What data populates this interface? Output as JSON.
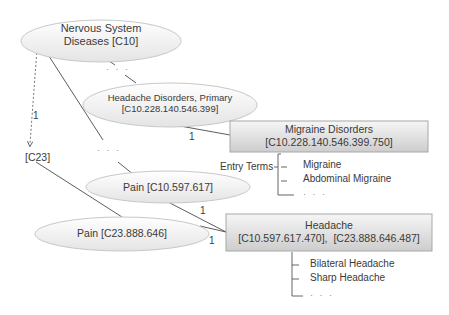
{
  "nodes": {
    "nervous_system": {
      "line1": "Nervous System",
      "line2": "Diseases [C10]",
      "shape": "ellipse"
    },
    "headache_disorders_primary": {
      "line1": "Headache Disorders, Primary",
      "line2": "[C10.228.140.546.399]",
      "shape": "ellipse"
    },
    "migraine_disorders": {
      "line1": "Migraine Disorders",
      "line2": "[C10.228.140.546.399.750]",
      "shape": "box"
    },
    "pain_c10": {
      "label": "Pain [C10.597.617]",
      "shape": "ellipse"
    },
    "pain_c23": {
      "label": "Pain [C23.888.646]",
      "shape": "ellipse"
    },
    "headache": {
      "line1": "Headache",
      "line2": "[C10.597.617.470],  [C23.888.646.487]",
      "shape": "box"
    },
    "c23": {
      "label": "[C23]",
      "shape": "text"
    }
  },
  "edge_labels": {
    "c10_to_c23": "1",
    "hdp_to_migraine": "1",
    "pain_c10_to_headache": "1",
    "pain_c23_to_headache": "1"
  },
  "ellipsis": "· · ·",
  "migraine_entry_terms": {
    "label": "Entry Terms",
    "items": [
      "Migraine",
      "Abdominal Migraine",
      "· · ·"
    ]
  },
  "headache_entry_terms": {
    "items": [
      "Bilateral Headache",
      "Sharp Headache",
      "· · ·"
    ]
  },
  "colors": {
    "ellipse_fill_top": "#ffffff",
    "ellipse_fill_bottom": "#e6e6e6",
    "ellipse_stroke": "#c8c8c8",
    "box_fill_top": "#f4f4f4",
    "box_fill_bottom": "#cfcfcf",
    "box_stroke": "#a8a8a8",
    "line": "#4a4a4a",
    "text": "#3a3a3a"
  }
}
